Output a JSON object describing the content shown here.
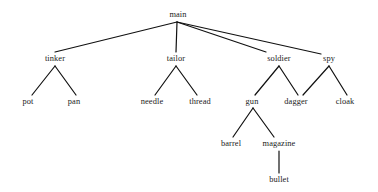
{
  "diagram": {
    "type": "tree",
    "title": "",
    "background_color": "#ffffff",
    "text_color": "#1a1a1a",
    "edge_color": "#111111",
    "font_style": "serif",
    "width": 378,
    "height": 192,
    "levels": 5,
    "nodes": [
      {
        "id": "main",
        "label": "main",
        "x": 178,
        "y": 15,
        "level": 0,
        "parent": null
      },
      {
        "id": "tinker",
        "label": "tinker",
        "x": 55,
        "y": 59,
        "level": 1,
        "parent": "main"
      },
      {
        "id": "tailor",
        "label": "tailor",
        "x": 176,
        "y": 59,
        "level": 1,
        "parent": "main"
      },
      {
        "id": "soldier",
        "label": "soldier",
        "x": 279,
        "y": 59,
        "level": 1,
        "parent": "main"
      },
      {
        "id": "spy",
        "label": "spy",
        "x": 329,
        "y": 59,
        "level": 1,
        "parent": "main"
      },
      {
        "id": "pot",
        "label": "pot",
        "x": 28,
        "y": 102,
        "level": 2,
        "parent": "tinker"
      },
      {
        "id": "pan",
        "label": "pan",
        "x": 74,
        "y": 102,
        "level": 2,
        "parent": "tinker"
      },
      {
        "id": "needle",
        "label": "needle",
        "x": 152,
        "y": 102,
        "level": 2,
        "parent": "tailor"
      },
      {
        "id": "thread",
        "label": "thread",
        "x": 200,
        "y": 102,
        "level": 2,
        "parent": "tailor"
      },
      {
        "id": "gun",
        "label": "gun",
        "x": 252,
        "y": 102,
        "level": 2,
        "parent": "soldier"
      },
      {
        "id": "dagger",
        "label": "dagger",
        "x": 296,
        "y": 102,
        "level": 2,
        "parent": "soldier"
      },
      {
        "id": "cloak",
        "label": "cloak",
        "x": 345,
        "y": 102,
        "level": 2,
        "parent": "spy"
      },
      {
        "id": "barrel",
        "label": "barrel",
        "x": 231,
        "y": 144,
        "level": 3,
        "parent": "gun"
      },
      {
        "id": "magazine",
        "label": "magazine",
        "x": 279,
        "y": 144,
        "level": 3,
        "parent": "gun"
      },
      {
        "id": "bullet",
        "label": "bullet",
        "x": 279,
        "y": 180,
        "level": 4,
        "parent": "magazine"
      }
    ],
    "edges": [
      {
        "from": "main",
        "to": "tinker",
        "x1": 177,
        "y1": 22,
        "x2": 55,
        "y2": 52
      },
      {
        "from": "main",
        "to": "tailor",
        "x1": 177,
        "y1": 22,
        "x2": 176,
        "y2": 52
      },
      {
        "from": "main",
        "to": "soldier",
        "x1": 177,
        "y1": 22,
        "x2": 266,
        "y2": 52
      },
      {
        "from": "main",
        "to": "spy",
        "x1": 177,
        "y1": 22,
        "x2": 321,
        "y2": 54
      },
      {
        "from": "tinker",
        "to": "pot",
        "x1": 55,
        "y1": 66,
        "x2": 32,
        "y2": 95
      },
      {
        "from": "tinker",
        "to": "pan",
        "x1": 55,
        "y1": 66,
        "x2": 76,
        "y2": 95
      },
      {
        "from": "tailor",
        "to": "needle",
        "x1": 176,
        "y1": 66,
        "x2": 155,
        "y2": 95
      },
      {
        "from": "tailor",
        "to": "thread",
        "x1": 176,
        "y1": 66,
        "x2": 197,
        "y2": 95
      },
      {
        "from": "soldier",
        "to": "gun",
        "x1": 279,
        "y1": 66,
        "x2": 255,
        "y2": 95
      },
      {
        "from": "soldier",
        "to": "dagger",
        "x1": 279,
        "y1": 66,
        "x2": 298,
        "y2": 95
      },
      {
        "from": "spy",
        "to": "dagger",
        "x1": 329,
        "y1": 66,
        "x2": 303,
        "y2": 95
      },
      {
        "from": "spy",
        "to": "cloak",
        "x1": 329,
        "y1": 66,
        "x2": 347,
        "y2": 95
      },
      {
        "from": "gun",
        "to": "barrel",
        "x1": 253,
        "y1": 108,
        "x2": 233,
        "y2": 137
      },
      {
        "from": "gun",
        "to": "magazine",
        "x1": 253,
        "y1": 108,
        "x2": 274,
        "y2": 137
      },
      {
        "from": "magazine",
        "to": "bullet",
        "x1": 279,
        "y1": 151,
        "x2": 279,
        "y2": 173
      }
    ]
  }
}
